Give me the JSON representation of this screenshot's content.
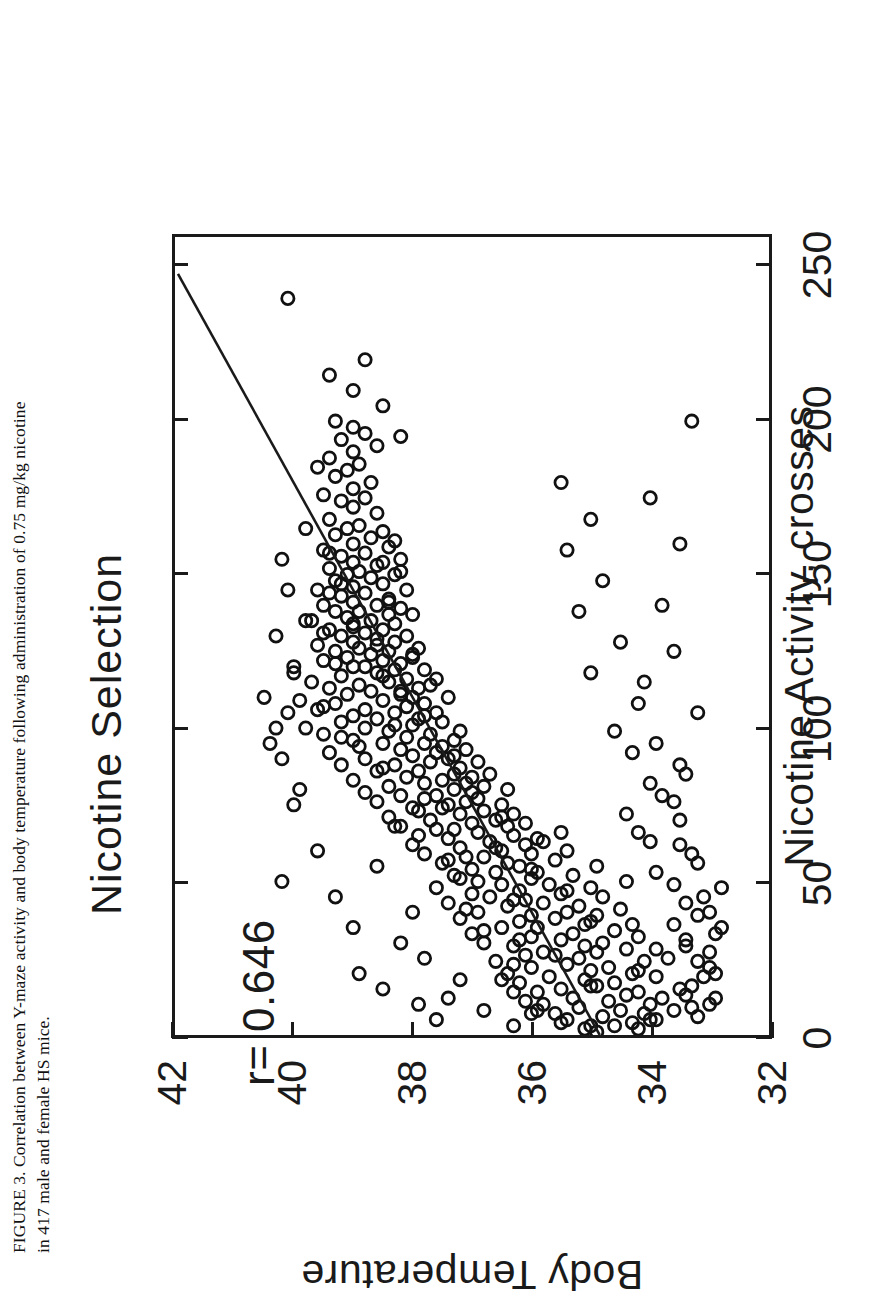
{
  "caption": {
    "line1": "FIGURE 3.  Correlation between Y-maze activity and body temperature following administration of 0.75 mg/kg nicotine",
    "line2": "in 417 male and female HS mice."
  },
  "chart_data": {
    "type": "scatter",
    "title": "Nicotine Selection",
    "xlabel": "Nicotine Activity, crosses",
    "ylabel": "Body Temperature",
    "xlim": [
      0,
      260
    ],
    "ylim": [
      32,
      42
    ],
    "xticks": [
      0,
      50,
      100,
      150,
      200,
      250
    ],
    "xtick_labels": [
      "0",
      "50",
      "100",
      "150",
      "200",
      "250"
    ],
    "yticks": [
      32,
      34,
      36,
      38,
      40,
      42
    ],
    "ytick_labels": [
      "32",
      "34",
      "36",
      "38",
      "40",
      "42"
    ],
    "grid": false,
    "legend": "none",
    "marker": "open-circle",
    "annotations": [
      {
        "name": "correlation-coefficient",
        "text": "r= 0.646",
        "x": 22,
        "y": 39.6
      }
    ],
    "fit_line": {
      "name": "regression-line",
      "x": [
        0,
        248
      ],
      "y": [
        34.85,
        41.95
      ]
    },
    "n_points": 417,
    "points": [
      [
        2,
        35.1
      ],
      [
        3,
        34.6
      ],
      [
        3,
        35.0
      ],
      [
        4,
        34.3
      ],
      [
        5,
        33.9
      ],
      [
        5,
        35.4
      ],
      [
        6,
        34.8
      ],
      [
        7,
        34.1
      ],
      [
        7,
        35.6
      ],
      [
        8,
        34.5
      ],
      [
        8,
        33.6
      ],
      [
        9,
        35.2
      ],
      [
        10,
        34.0
      ],
      [
        10,
        35.8
      ],
      [
        11,
        34.7
      ],
      [
        12,
        33.8
      ],
      [
        12,
        35.3
      ],
      [
        13,
        34.4
      ],
      [
        14,
        35.9
      ],
      [
        14,
        34.2
      ],
      [
        15,
        33.5
      ],
      [
        15,
        35.5
      ],
      [
        16,
        34.9
      ],
      [
        17,
        36.2
      ],
      [
        17,
        34.6
      ],
      [
        18,
        35.1
      ],
      [
        19,
        33.9
      ],
      [
        19,
        35.7
      ],
      [
        20,
        34.3
      ],
      [
        20,
        36.4
      ],
      [
        21,
        35.0
      ],
      [
        22,
        34.7
      ],
      [
        22,
        36.0
      ],
      [
        23,
        35.4
      ],
      [
        24,
        34.1
      ],
      [
        24,
        36.6
      ],
      [
        25,
        35.2
      ],
      [
        25,
        33.7
      ],
      [
        26,
        36.1
      ],
      [
        27,
        34.9
      ],
      [
        27,
        35.8
      ],
      [
        28,
        34.4
      ],
      [
        29,
        36.3
      ],
      [
        29,
        35.1
      ],
      [
        30,
        34.8
      ],
      [
        30,
        36.8
      ],
      [
        31,
        35.5
      ],
      [
        32,
        34.2
      ],
      [
        32,
        36.0
      ],
      [
        33,
        35.3
      ],
      [
        33,
        37.0
      ],
      [
        34,
        34.6
      ],
      [
        35,
        35.9
      ],
      [
        35,
        36.5
      ],
      [
        36,
        35.1
      ],
      [
        36,
        34.3
      ],
      [
        37,
        36.2
      ],
      [
        38,
        35.6
      ],
      [
        38,
        37.2
      ],
      [
        39,
        34.9
      ],
      [
        39,
        36.0
      ],
      [
        40,
        35.4
      ],
      [
        40,
        36.9
      ],
      [
        41,
        34.5
      ],
      [
        42,
        36.4
      ],
      [
        42,
        35.2
      ],
      [
        43,
        37.4
      ],
      [
        43,
        35.8
      ],
      [
        44,
        36.1
      ],
      [
        45,
        34.8
      ],
      [
        45,
        36.7
      ],
      [
        46,
        35.5
      ],
      [
        46,
        37.0
      ],
      [
        47,
        36.2
      ],
      [
        48,
        35.0
      ],
      [
        48,
        37.6
      ],
      [
        49,
        36.5
      ],
      [
        49,
        35.7
      ],
      [
        50,
        34.4
      ],
      [
        50,
        36.9
      ],
      [
        51,
        36.0
      ],
      [
        52,
        35.3
      ],
      [
        52,
        37.3
      ],
      [
        53,
        36.6
      ],
      [
        53,
        35.9
      ],
      [
        54,
        37.0
      ],
      [
        55,
        36.2
      ],
      [
        55,
        34.9
      ],
      [
        56,
        37.5
      ],
      [
        56,
        36.4
      ],
      [
        57,
        35.6
      ],
      [
        58,
        37.1
      ],
      [
        58,
        36.8
      ],
      [
        59,
        36.0
      ],
      [
        59,
        37.8
      ],
      [
        60,
        35.4
      ],
      [
        60,
        36.5
      ],
      [
        61,
        37.2
      ],
      [
        62,
        36.1
      ],
      [
        62,
        38.0
      ],
      [
        63,
        36.7
      ],
      [
        63,
        35.8
      ],
      [
        64,
        37.4
      ],
      [
        65,
        36.3
      ],
      [
        65,
        37.9
      ],
      [
        66,
        36.9
      ],
      [
        66,
        35.5
      ],
      [
        67,
        37.6
      ],
      [
        68,
        36.4
      ],
      [
        68,
        38.2
      ],
      [
        69,
        37.0
      ],
      [
        69,
        36.1
      ],
      [
        70,
        37.7
      ],
      [
        70,
        36.6
      ],
      [
        71,
        38.4
      ],
      [
        72,
        37.2
      ],
      [
        72,
        36.3
      ],
      [
        73,
        37.9
      ],
      [
        73,
        36.8
      ],
      [
        74,
        38.0
      ],
      [
        75,
        37.4
      ],
      [
        75,
        36.5
      ],
      [
        76,
        38.6
      ],
      [
        76,
        37.1
      ],
      [
        77,
        36.9
      ],
      [
        78,
        38.2
      ],
      [
        78,
        37.6
      ],
      [
        79,
        37.0
      ],
      [
        79,
        38.8
      ],
      [
        80,
        37.3
      ],
      [
        80,
        36.4
      ],
      [
        81,
        38.4
      ],
      [
        82,
        37.8
      ],
      [
        82,
        37.1
      ],
      [
        83,
        39.0
      ],
      [
        83,
        37.5
      ],
      [
        84,
        38.1
      ],
      [
        85,
        37.3
      ],
      [
        85,
        36.7
      ],
      [
        86,
        38.6
      ],
      [
        86,
        37.9
      ],
      [
        87,
        37.2
      ],
      [
        88,
        38.3
      ],
      [
        88,
        39.2
      ],
      [
        89,
        37.7
      ],
      [
        89,
        36.9
      ],
      [
        90,
        38.8
      ],
      [
        90,
        37.4
      ],
      [
        91,
        38.0
      ],
      [
        92,
        37.6
      ],
      [
        92,
        39.4
      ],
      [
        93,
        38.2
      ],
      [
        93,
        37.1
      ],
      [
        94,
        38.9
      ],
      [
        95,
        37.8
      ],
      [
        95,
        38.5
      ],
      [
        96,
        37.3
      ],
      [
        96,
        39.0
      ],
      [
        97,
        38.1
      ],
      [
        98,
        37.7
      ],
      [
        98,
        39.5
      ],
      [
        99,
        38.4
      ],
      [
        99,
        37.2
      ],
      [
        100,
        38.8
      ],
      [
        100,
        39.8
      ],
      [
        101,
        38.0
      ],
      [
        102,
        37.5
      ],
      [
        102,
        39.2
      ],
      [
        103,
        38.6
      ],
      [
        103,
        37.9
      ],
      [
        104,
        39.0
      ],
      [
        105,
        38.3
      ],
      [
        105,
        37.6
      ],
      [
        106,
        39.6
      ],
      [
        106,
        38.8
      ],
      [
        107,
        38.1
      ],
      [
        108,
        39.3
      ],
      [
        108,
        37.8
      ],
      [
        109,
        38.5
      ],
      [
        109,
        39.9
      ],
      [
        110,
        38.0
      ],
      [
        110,
        37.4
      ],
      [
        111,
        39.1
      ],
      [
        112,
        38.7
      ],
      [
        112,
        38.2
      ],
      [
        113,
        39.4
      ],
      [
        113,
        37.9
      ],
      [
        114,
        38.9
      ],
      [
        115,
        38.4
      ],
      [
        115,
        39.7
      ],
      [
        116,
        38.1
      ],
      [
        116,
        37.6
      ],
      [
        117,
        39.2
      ],
      [
        118,
        38.6
      ],
      [
        118,
        40.0
      ],
      [
        119,
        38.3
      ],
      [
        119,
        37.8
      ],
      [
        120,
        39.0
      ],
      [
        120,
        38.8
      ],
      [
        121,
        38.2
      ],
      [
        122,
        39.5
      ],
      [
        122,
        38.5
      ],
      [
        123,
        39.1
      ],
      [
        123,
        38.0
      ],
      [
        124,
        38.7
      ],
      [
        125,
        39.3
      ],
      [
        125,
        38.4
      ],
      [
        126,
        38.9
      ],
      [
        126,
        37.9
      ],
      [
        127,
        39.6
      ],
      [
        128,
        38.3
      ],
      [
        128,
        39.0
      ],
      [
        129,
        38.6
      ],
      [
        130,
        39.2
      ],
      [
        130,
        38.1
      ],
      [
        131,
        38.8
      ],
      [
        132,
        39.4
      ],
      [
        132,
        38.5
      ],
      [
        133,
        39.0
      ],
      [
        134,
        38.3
      ],
      [
        135,
        39.7
      ],
      [
        135,
        38.7
      ],
      [
        136,
        39.1
      ],
      [
        137,
        38.4
      ],
      [
        138,
        39.3
      ],
      [
        138,
        38.9
      ],
      [
        139,
        38.2
      ],
      [
        140,
        39.5
      ],
      [
        140,
        38.6
      ],
      [
        141,
        39.0
      ],
      [
        142,
        38.4
      ],
      [
        143,
        39.2
      ],
      [
        144,
        38.8
      ],
      [
        145,
        39.6
      ],
      [
        145,
        38.1
      ],
      [
        146,
        39.0
      ],
      [
        147,
        38.5
      ],
      [
        148,
        39.3
      ],
      [
        149,
        38.7
      ],
      [
        150,
        39.1
      ],
      [
        150,
        38.3
      ],
      [
        151,
        38.9
      ],
      [
        152,
        39.4
      ],
      [
        153,
        38.6
      ],
      [
        154,
        39.0
      ],
      [
        155,
        38.2
      ],
      [
        156,
        39.2
      ],
      [
        157,
        38.8
      ],
      [
        158,
        39.5
      ],
      [
        159,
        38.4
      ],
      [
        160,
        39.0
      ],
      [
        162,
        38.7
      ],
      [
        163,
        39.3
      ],
      [
        164,
        38.5
      ],
      [
        165,
        39.1
      ],
      [
        166,
        38.9
      ],
      [
        168,
        39.4
      ],
      [
        170,
        38.6
      ],
      [
        172,
        39.0
      ],
      [
        174,
        39.2
      ],
      [
        175,
        38.8
      ],
      [
        176,
        39.5
      ],
      [
        178,
        39.0
      ],
      [
        180,
        38.7
      ],
      [
        182,
        39.3
      ],
      [
        184,
        39.1
      ],
      [
        186,
        38.9
      ],
      [
        188,
        39.4
      ],
      [
        190,
        39.0
      ],
      [
        192,
        38.6
      ],
      [
        194,
        39.2
      ],
      [
        196,
        38.8
      ],
      [
        198,
        39.0
      ],
      [
        200,
        39.3
      ],
      [
        205,
        38.5
      ],
      [
        210,
        39.0
      ],
      [
        215,
        39.4
      ],
      [
        220,
        38.8
      ],
      [
        240,
        40.1
      ],
      [
        5,
        34.0
      ],
      [
        8,
        35.9
      ],
      [
        11,
        36.1
      ],
      [
        13,
        33.4
      ],
      [
        16,
        35.0
      ],
      [
        18,
        36.5
      ],
      [
        21,
        34.2
      ],
      [
        23,
        36.3
      ],
      [
        26,
        35.6
      ],
      [
        28,
        33.9
      ],
      [
        31,
        36.2
      ],
      [
        34,
        36.8
      ],
      [
        37,
        35.0
      ],
      [
        41,
        37.1
      ],
      [
        44,
        36.3
      ],
      [
        47,
        35.4
      ],
      [
        51,
        37.2
      ],
      [
        54,
        36.0
      ],
      [
        57,
        37.4
      ],
      [
        61,
        36.6
      ],
      [
        64,
        35.9
      ],
      [
        67,
        37.3
      ],
      [
        71,
        36.5
      ],
      [
        74,
        37.5
      ],
      [
        77,
        37.8
      ],
      [
        81,
        36.8
      ],
      [
        84,
        37.0
      ],
      [
        87,
        38.5
      ],
      [
        91,
        37.3
      ],
      [
        94,
        37.5
      ],
      [
        97,
        39.2
      ],
      [
        101,
        38.3
      ],
      [
        104,
        37.8
      ],
      [
        107,
        39.5
      ],
      [
        111,
        38.2
      ],
      [
        114,
        37.7
      ],
      [
        117,
        38.5
      ],
      [
        121,
        39.3
      ],
      [
        124,
        38.0
      ],
      [
        127,
        38.6
      ],
      [
        131,
        39.5
      ],
      [
        134,
        39.0
      ],
      [
        137,
        38.0
      ],
      [
        141,
        38.4
      ],
      [
        144,
        39.4
      ],
      [
        147,
        39.2
      ],
      [
        151,
        38.2
      ],
      [
        154,
        38.5
      ],
      [
        157,
        39.4
      ],
      [
        161,
        38.3
      ],
      [
        9,
        33.3
      ],
      [
        19,
        33.1
      ],
      [
        29,
        33.4
      ],
      [
        39,
        33.2
      ],
      [
        49,
        33.6
      ],
      [
        59,
        33.3
      ],
      [
        12,
        32.9
      ],
      [
        22,
        33.0
      ],
      [
        35,
        32.8
      ],
      [
        45,
        33.1
      ],
      [
        63,
        34.0
      ],
      [
        70,
        33.5
      ],
      [
        78,
        33.8
      ],
      [
        85,
        33.4
      ],
      [
        95,
        33.9
      ],
      [
        105,
        33.2
      ],
      [
        115,
        34.1
      ],
      [
        125,
        33.6
      ],
      [
        140,
        33.8
      ],
      [
        160,
        33.5
      ],
      [
        175,
        34.0
      ],
      [
        195,
        38.2
      ],
      [
        200,
        33.3
      ],
      [
        1,
        34.9
      ],
      [
        2,
        34.2
      ],
      [
        4,
        35.5
      ],
      [
        6,
        33.2
      ],
      [
        7,
        36.0
      ],
      [
        10,
        33.0
      ],
      [
        14,
        36.3
      ],
      [
        16,
        33.3
      ],
      [
        20,
        32.9
      ],
      [
        24,
        33.2
      ],
      [
        27,
        33.0
      ],
      [
        31,
        33.4
      ],
      [
        33,
        32.9
      ],
      [
        36,
        33.6
      ],
      [
        40,
        33.0
      ],
      [
        43,
        33.4
      ],
      [
        48,
        32.8
      ],
      [
        53,
        33.9
      ],
      [
        56,
        33.2
      ],
      [
        62,
        33.5
      ],
      [
        66,
        34.2
      ],
      [
        72,
        34.4
      ],
      [
        76,
        33.6
      ],
      [
        82,
        34.0
      ],
      [
        88,
        33.5
      ],
      [
        92,
        34.3
      ],
      [
        99,
        34.6
      ],
      [
        108,
        34.2
      ],
      [
        118,
        35.0
      ],
      [
        128,
        34.5
      ],
      [
        138,
        35.2
      ],
      [
        148,
        34.8
      ],
      [
        158,
        35.4
      ],
      [
        168,
        35.0
      ],
      [
        180,
        35.5
      ],
      [
        100,
        40.3
      ],
      [
        75,
        40.0
      ],
      [
        60,
        39.6
      ],
      [
        45,
        39.3
      ],
      [
        30,
        38.2
      ],
      [
        20,
        38.9
      ],
      [
        15,
        38.5
      ],
      [
        10,
        37.9
      ],
      [
        5,
        37.6
      ],
      [
        50,
        40.2
      ],
      [
        35,
        39.0
      ],
      [
        25,
        37.8
      ],
      [
        18,
        37.2
      ],
      [
        12,
        37.4
      ],
      [
        8,
        36.8
      ],
      [
        3,
        36.3
      ],
      [
        90,
        40.2
      ],
      [
        110,
        40.5
      ],
      [
        55,
        38.6
      ],
      [
        68,
        38.3
      ],
      [
        80,
        39.9
      ],
      [
        40,
        38.0
      ],
      [
        120,
        40.0
      ],
      [
        130,
        40.3
      ],
      [
        145,
        40.1
      ],
      [
        165,
        39.8
      ],
      [
        185,
        39.6
      ],
      [
        155,
        40.2
      ],
      [
        135,
        39.8
      ],
      [
        105,
        40.1
      ],
      [
        95,
        40.4
      ]
    ]
  }
}
